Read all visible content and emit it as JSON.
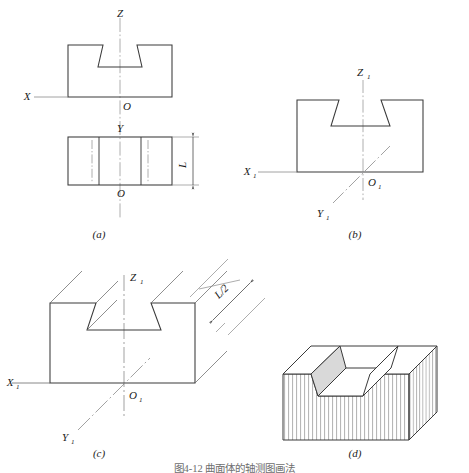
{
  "figure": {
    "caption": "图4-12  曲面体的轴测图画法",
    "panels": [
      {
        "id": "a",
        "label": "(a)",
        "description": "two-view orthographic projection of dovetail block",
        "axis_labels": [
          "Z",
          "X",
          "O",
          "Y",
          "O"
        ],
        "dimension_labels": [
          "L"
        ]
      },
      {
        "id": "b",
        "label": "(b)",
        "description": "axonometric axes with front face outline",
        "axis_labels": [
          "Z1",
          "X1",
          "Y1",
          "O1"
        ],
        "dimension_labels": []
      },
      {
        "id": "c",
        "label": "(c)",
        "description": "depth construction lines at 45 degrees",
        "axis_labels": [
          "Z1",
          "X1",
          "Y1",
          "O1"
        ],
        "dimension_labels": [
          "L/2"
        ]
      },
      {
        "id": "d",
        "label": "(d)",
        "description": "completed oblique axonometric solid with hatching",
        "axis_labels": [],
        "dimension_labels": []
      }
    ]
  },
  "labels": {
    "z": "Z",
    "x": "X",
    "y": "Y",
    "o": "O",
    "z1_main": "Z",
    "x1_main": "X",
    "y1_main": "Y",
    "o1_main": "O",
    "sub_one": "1",
    "dim_L": "L",
    "dim_L_half": "L/2",
    "panel_a": "(a)",
    "panel_b": "(b)",
    "panel_c": "(c)",
    "panel_d": "(d)"
  },
  "style": {
    "line_color": "#3a3a3a",
    "thin_line_color": "#6a6a6a",
    "center_line_color": "#9a9a9a",
    "hatch_color": "#8a8a8a",
    "shade_fill": "#d9d9d9",
    "background": "#ffffff"
  }
}
